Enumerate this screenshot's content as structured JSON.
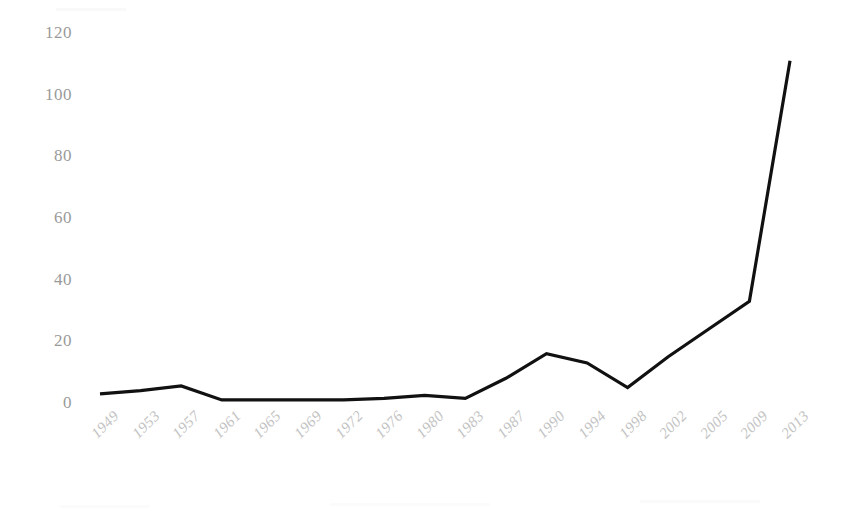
{
  "chart_data": {
    "type": "line",
    "title": "",
    "subtitle": "",
    "xlabel": "",
    "ylabel": "",
    "categories": [
      "1949",
      "1953",
      "1957",
      "1961",
      "1965",
      "1969",
      "1972",
      "1976",
      "1980",
      "1983",
      "1987",
      "1990",
      "1994",
      "1998",
      "2002",
      "2005",
      "2009",
      "2013"
    ],
    "series": [
      {
        "name": "",
        "values": [
          3,
          4,
          5.5,
          1,
          1,
          1,
          1,
          1.5,
          2.5,
          1.5,
          8,
          16,
          13,
          5,
          15,
          24,
          33,
          111
        ]
      }
    ],
    "ylim": [
      0,
      120
    ],
    "yticks": [
      0,
      20,
      40,
      60,
      80,
      100,
      120
    ],
    "ytick_labels": [
      "0",
      "20",
      "40",
      "60",
      "80",
      "100",
      "120"
    ],
    "grid": false,
    "legend": "none",
    "line_color": "#111111",
    "axis_label_color": "#9a9a9a",
    "xtick_label_color": "#c2c2c2",
    "background_color": "#ffffff"
  },
  "axis": {
    "y_ticks": [
      {
        "label": "120",
        "value": 120
      },
      {
        "label": "100",
        "value": 100
      },
      {
        "label": "80",
        "value": 80
      },
      {
        "label": "60",
        "value": 60
      },
      {
        "label": "40",
        "value": 40
      },
      {
        "label": "20",
        "value": 20
      },
      {
        "label": "0",
        "value": 0
      }
    ],
    "x_ticks": [
      {
        "label": "1949"
      },
      {
        "label": "1953"
      },
      {
        "label": "1957"
      },
      {
        "label": "1961"
      },
      {
        "label": "1965"
      },
      {
        "label": "1969"
      },
      {
        "label": "1972"
      },
      {
        "label": "1976"
      },
      {
        "label": "1980"
      },
      {
        "label": "1983"
      },
      {
        "label": "1987"
      },
      {
        "label": "1990"
      },
      {
        "label": "1994"
      },
      {
        "label": "1998"
      },
      {
        "label": "2002"
      },
      {
        "label": "2005"
      },
      {
        "label": "2009"
      },
      {
        "label": "2013"
      }
    ]
  }
}
